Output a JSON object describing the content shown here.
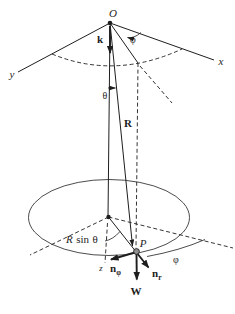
{
  "figure": {
    "type": "spherical-pendulum-coordinate-diagram",
    "colors": {
      "line": "#1e1e1e",
      "background": "#ffffff",
      "point_p_fill": "#8f8f8f"
    },
    "labels": {
      "origin": "O",
      "x_axis": "x",
      "y_axis": "y",
      "z_axis": "z",
      "k_vector": "k",
      "phi_top": "φ",
      "theta": "θ",
      "r_vector": "R",
      "radius_expr_r": "R",
      "radius_expr_sin": "sin",
      "radius_expr_theta": "θ",
      "point_p": "P",
      "phi_bottom": "φ",
      "n_vector_phi_base": "n",
      "n_vector_phi_sub": "φ",
      "n_vector_r_base": "n",
      "n_vector_r_sub": "r",
      "weight_vector": "W"
    }
  }
}
